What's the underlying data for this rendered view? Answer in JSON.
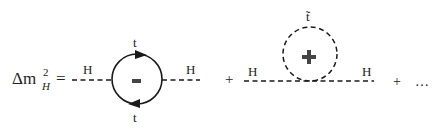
{
  "equation": {
    "lhs": "Δm",
    "lhs_sup": "2",
    "lhs_sub": "H",
    "equals": "="
  },
  "diagram1": {
    "left_label": "H",
    "right_label": "H",
    "top_label": "t",
    "bottom_label": "t",
    "sign": "-",
    "loop_type": "fermion-loop"
  },
  "plus1": "+",
  "diagram2": {
    "left_label": "H",
    "right_label": "H",
    "top_label": "t̃",
    "sign": "+",
    "loop_type": "scalar-loop"
  },
  "plus2": "+",
  "ellipsis": "…",
  "colors": {
    "line": "#1a1a1a",
    "text": "#222222",
    "sign": "#444444"
  }
}
